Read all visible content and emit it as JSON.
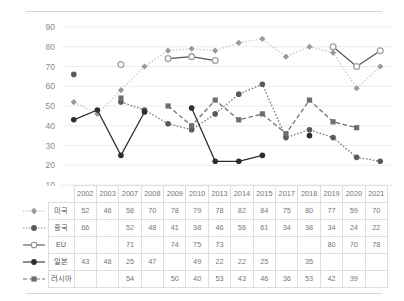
{
  "chart_data": {
    "type": "line",
    "title": "",
    "xlabel": "",
    "ylabel": "",
    "ylim": [
      10,
      90
    ],
    "yticks": [
      10,
      20,
      30,
      40,
      50,
      60,
      70,
      80,
      90
    ],
    "grid": true,
    "legend_position": "table-left-column",
    "categories": [
      "2002",
      "2003",
      "2007",
      "2008",
      "2009",
      "2010",
      "2013",
      "2014",
      "2015",
      "2017",
      "2018",
      "2019",
      "2020",
      "2021"
    ],
    "series": [
      {
        "name": "미국",
        "marker": "diamond",
        "line": "dotted",
        "color": "#c9c9c9",
        "marker_color": "#9a9a9a",
        "values": [
          52,
          46,
          58,
          70,
          78,
          79,
          78,
          82,
          84,
          75,
          80,
          77,
          59,
          70
        ]
      },
      {
        "name": "중국",
        "marker": "circle",
        "line": "dotted",
        "color": "#777777",
        "marker_color": "#5a5a5a",
        "values": [
          66,
          null,
          52,
          48,
          41,
          38,
          46,
          56,
          61,
          34,
          38,
          34,
          24,
          22
        ]
      },
      {
        "name": "EU",
        "marker": "circle-open",
        "line": "solid",
        "color": "#555555",
        "marker_color": "#9f9f9f",
        "values": [
          null,
          null,
          71,
          null,
          74,
          75,
          73,
          null,
          null,
          null,
          null,
          80,
          70,
          78
        ]
      },
      {
        "name": "일본",
        "marker": "circle-filled",
        "line": "solid",
        "color": "#2e2e2e",
        "marker_color": "#2e2e2e",
        "values": [
          43,
          48,
          25,
          47,
          null,
          49,
          22,
          22,
          25,
          null,
          35,
          null,
          null,
          null
        ]
      },
      {
        "name": "러시아",
        "marker": "square",
        "line": "dashed",
        "color": "#6e6e6e",
        "marker_color": "#6e6e6e",
        "values": [
          null,
          null,
          54,
          null,
          50,
          40,
          53,
          43,
          46,
          36,
          53,
          42,
          39,
          null
        ]
      }
    ]
  },
  "table": {
    "header_blank_legend": "",
    "header_blank_name": "",
    "columns": [
      "2002",
      "2003",
      "2007",
      "2008",
      "2009",
      "2010",
      "2013",
      "2014",
      "2015",
      "2017",
      "2018",
      "2019",
      "2020",
      "2021"
    ],
    "rows": [
      {
        "name": "미국",
        "legend_icon": "legend-diamond-dotted",
        "cells": [
          "52",
          "46",
          "58",
          "70",
          "78",
          "79",
          "78",
          "82",
          "84",
          "75",
          "80",
          "77",
          "59",
          "70"
        ]
      },
      {
        "name": "중국",
        "legend_icon": "legend-circle-dotted",
        "cells": [
          "66",
          "",
          "52",
          "48",
          "41",
          "38",
          "46",
          "56",
          "61",
          "34",
          "38",
          "34",
          "24",
          "22"
        ]
      },
      {
        "name": "EU",
        "legend_icon": "legend-circle-open-solid",
        "cells": [
          "",
          "",
          "71",
          "",
          "74",
          "75",
          "73",
          "",
          "",
          "",
          "",
          "80",
          "70",
          "78"
        ]
      },
      {
        "name": "일본",
        "legend_icon": "legend-circle-filled-solid",
        "cells": [
          "43",
          "48",
          "25",
          "47",
          "",
          "49",
          "22",
          "22",
          "25",
          "",
          "35",
          "",
          "",
          ""
        ]
      },
      {
        "name": "러시아",
        "legend_icon": "legend-square-dashed",
        "cells": [
          "",
          "",
          "54",
          "",
          "50",
          "40",
          "53",
          "43",
          "46",
          "36",
          "53",
          "42",
          "39",
          ""
        ]
      }
    ]
  }
}
